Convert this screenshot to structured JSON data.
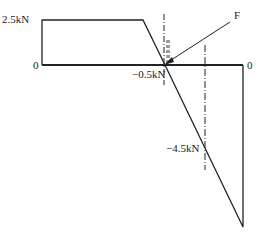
{
  "diagram": {
    "type": "shear-force-diagram",
    "labels": {
      "top_value": "2.5kN",
      "left_zero": "0",
      "right_zero": "0",
      "mid_value": "−0.5kN",
      "bottom_value": "−4.5kN",
      "force": "F"
    },
    "values_kN": {
      "left_segment": 2.5,
      "at_force": -0.5,
      "lower_marker": -4.5
    },
    "colors": {
      "line": "#222222",
      "background": "#ffffff"
    }
  }
}
